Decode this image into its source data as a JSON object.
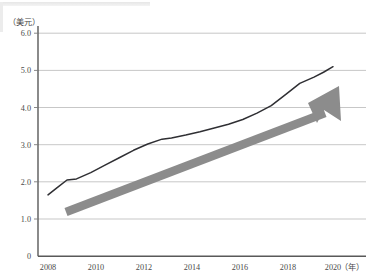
{
  "chart_data": {
    "type": "line",
    "title": "",
    "subtitle": "",
    "xlabel": "（年）",
    "ylabel": "（美元）",
    "xlim": [
      2007.6,
      2020.8
    ],
    "ylim": [
      0,
      6.3
    ],
    "grid": true,
    "legend": "none",
    "y_ticks": [
      "6.0",
      "5.0",
      "4.0",
      "3.0",
      "2.0",
      "1.0",
      "0"
    ],
    "y_tick_values": [
      6.0,
      5.0,
      4.0,
      3.0,
      2.0,
      1.0,
      0
    ],
    "x_ticks": [
      "2008",
      "2010",
      "2012",
      "2014",
      "2016",
      "2018",
      "2020"
    ],
    "x_tick_values": [
      2008,
      2010,
      2012,
      2014,
      2016,
      2018,
      2020
    ],
    "series": [
      {
        "name": "价格",
        "color": "#2f2f33",
        "x": [
          2008.0,
          2008.4,
          2008.8,
          2009.2,
          2009.8,
          2010.4,
          2011.0,
          2011.6,
          2012.2,
          2012.8,
          2013.2,
          2013.8,
          2014.4,
          2015.0,
          2015.6,
          2016.2,
          2016.8,
          2017.4,
          2018.0,
          2018.6,
          2019.2,
          2019.6,
          2020.0
        ],
        "values": [
          1.65,
          1.85,
          2.05,
          2.08,
          2.25,
          2.45,
          2.65,
          2.85,
          3.02,
          3.15,
          3.18,
          3.26,
          3.35,
          3.45,
          3.55,
          3.68,
          3.85,
          4.05,
          4.35,
          4.65,
          4.82,
          4.95,
          5.1
        ]
      }
    ],
    "annotations": [
      {
        "type": "trend-arrow",
        "color": "#8c8c8c",
        "start": {
          "x": 2008.7,
          "y": 1.22
        },
        "end": {
          "x": 2020.1,
          "y": 4.5
        },
        "description": "上升趋势箭头"
      }
    ]
  },
  "axes": {
    "y_axis_unit": "（美元）",
    "x_axis_unit": "（年）"
  }
}
